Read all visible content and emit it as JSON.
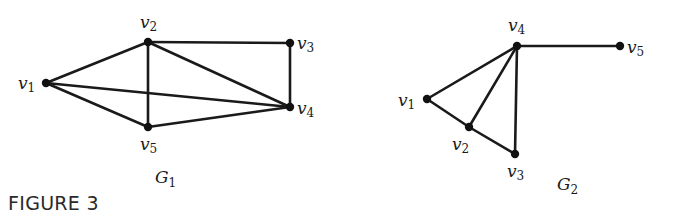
{
  "figure": {
    "caption": "FIGURE 3",
    "graphs": [
      {
        "id": "G1",
        "label": "G",
        "label_sub": "1",
        "label_pos": [
          155,
          183
        ],
        "nodes": [
          {
            "id": "v1",
            "name": "v",
            "sub": "1",
            "x": 46,
            "y": 83,
            "lx": 18,
            "ly": 89
          },
          {
            "id": "v2",
            "name": "v",
            "sub": "2",
            "x": 148,
            "y": 42,
            "lx": 140,
            "ly": 28
          },
          {
            "id": "v3",
            "name": "v",
            "sub": "3",
            "x": 290,
            "y": 43,
            "lx": 297,
            "ly": 49
          },
          {
            "id": "v4",
            "name": "v",
            "sub": "4",
            "x": 290,
            "y": 107,
            "lx": 297,
            "ly": 114
          },
          {
            "id": "v5",
            "name": "v",
            "sub": "5",
            "x": 148,
            "y": 127,
            "lx": 140,
            "ly": 150
          }
        ],
        "edges": [
          [
            "v1",
            "v2"
          ],
          [
            "v1",
            "v4"
          ],
          [
            "v1",
            "v5"
          ],
          [
            "v2",
            "v3"
          ],
          [
            "v2",
            "v4"
          ],
          [
            "v2",
            "v5"
          ],
          [
            "v3",
            "v4"
          ],
          [
            "v4",
            "v5"
          ]
        ]
      },
      {
        "id": "G2",
        "label": "G",
        "label_sub": "2",
        "label_pos": [
          557,
          190
        ],
        "nodes": [
          {
            "id": "v1",
            "name": "v",
            "sub": "1",
            "x": 427,
            "y": 99,
            "lx": 398,
            "ly": 106
          },
          {
            "id": "v2",
            "name": "v",
            "sub": "2",
            "x": 469,
            "y": 127,
            "lx": 452,
            "ly": 150
          },
          {
            "id": "v3",
            "name": "v",
            "sub": "3",
            "x": 515,
            "y": 154,
            "lx": 507,
            "ly": 177
          },
          {
            "id": "v4",
            "name": "v",
            "sub": "4",
            "x": 517,
            "y": 46,
            "lx": 508,
            "ly": 31
          },
          {
            "id": "v5",
            "name": "v",
            "sub": "5",
            "x": 620,
            "y": 46,
            "lx": 627,
            "ly": 53
          }
        ],
        "edges": [
          [
            "v1",
            "v4"
          ],
          [
            "v1",
            "v2"
          ],
          [
            "v2",
            "v4"
          ],
          [
            "v2",
            "v3"
          ],
          [
            "v3",
            "v4"
          ],
          [
            "v4",
            "v5"
          ]
        ]
      }
    ]
  },
  "colors": {
    "ink": "#1a1a1a",
    "background": "#ffffff"
  }
}
